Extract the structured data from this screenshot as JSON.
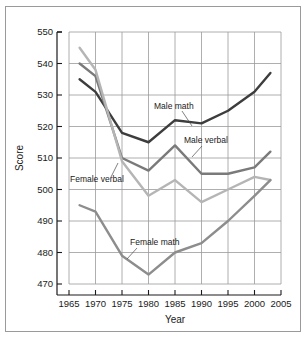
{
  "figure": {
    "background": "#ffffff",
    "border_color": "#9a9a9a"
  },
  "chart_data": {
    "type": "line",
    "title": "",
    "xlabel": "Year",
    "ylabel": "Score",
    "xlim": [
      1965,
      2005
    ],
    "ylim": [
      470,
      550
    ],
    "xticks": [
      1965,
      1970,
      1975,
      1980,
      1985,
      1990,
      1995,
      2000,
      2005
    ],
    "yticks": [
      470,
      480,
      490,
      500,
      510,
      520,
      530,
      540,
      550
    ],
    "xtick_labels": [
      "1965",
      "1970",
      "1975",
      "1980",
      "1985",
      "1990",
      "1995",
      "2000",
      "2005"
    ],
    "ytick_labels": [
      "470",
      "480",
      "490",
      "500",
      "510",
      "520",
      "530",
      "540",
      "550"
    ],
    "grid": true,
    "legend": "none",
    "annotations": [
      {
        "label": "Male math",
        "x": 148,
        "y": 102,
        "leader": [
          [
            176,
            104
          ],
          [
            186,
            119
          ]
        ]
      },
      {
        "label": "Male verbal",
        "x": 178,
        "y": 136,
        "leader": [
          [
            196,
            139
          ],
          [
            186,
            150
          ]
        ]
      },
      {
        "label": "Female verbal",
        "x": 64,
        "y": 175,
        "leader": [
          [
            105,
            170
          ],
          [
            112,
            156
          ]
        ]
      },
      {
        "label": "Female math",
        "x": 124,
        "y": 238,
        "leader": [
          [
            131,
            241
          ],
          [
            121,
            252
          ]
        ]
      }
    ],
    "series": [
      {
        "name": "Male math",
        "color": "#3d3d3d",
        "width": 2.4,
        "x": [
          1967,
          1970,
          1975,
          1980,
          1985,
          1990,
          1995,
          2000,
          2003
        ],
        "values": [
          535,
          531,
          518,
          515,
          522,
          521,
          525,
          531,
          537
        ]
      },
      {
        "name": "Male verbal",
        "color": "#7a7a7a",
        "width": 2.4,
        "x": [
          1967,
          1970,
          1975,
          1980,
          1985,
          1990,
          1995,
          2000,
          2003
        ],
        "values": [
          540,
          536,
          510,
          506,
          514,
          505,
          505,
          507,
          512
        ]
      },
      {
        "name": "Female verbal",
        "color": "#b5b5b5",
        "width": 2.4,
        "x": [
          1967,
          1970,
          1975,
          1980,
          1985,
          1990,
          1995,
          2000,
          2003
        ],
        "values": [
          545,
          538,
          509,
          498,
          503,
          496,
          500,
          504,
          503
        ]
      },
      {
        "name": "Female math",
        "color": "#8d8d8d",
        "width": 2.4,
        "x": [
          1967,
          1970,
          1975,
          1980,
          1985,
          1990,
          1995,
          2000,
          2003
        ],
        "values": [
          495,
          493,
          479,
          473,
          480,
          483,
          490,
          498,
          503
        ]
      }
    ]
  }
}
